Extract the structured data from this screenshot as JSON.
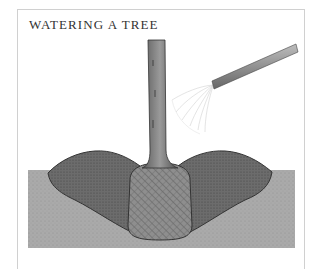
{
  "figure": {
    "title": "WATERING A TREE",
    "illustration": {
      "subject": "tree-planting-cross-section",
      "elements": [
        "tree-trunk",
        "root-ball",
        "soil-berm-left",
        "soil-berm-right",
        "ground-soil",
        "garden-hose",
        "water-spray"
      ]
    },
    "colors": {
      "frame_border": "#d0d0d0",
      "ground": "#a9a9a9",
      "berm": "#6e6e6e",
      "root_ball": "#8a8a8a",
      "trunk": "#7d7d7d",
      "hose": "#9a9a9a",
      "title_text": "#333333"
    }
  }
}
